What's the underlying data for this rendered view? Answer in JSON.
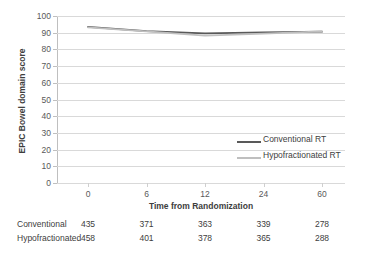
{
  "chart_data": {
    "type": "line",
    "title": "",
    "xlabel": "Time from Randomization",
    "ylabel": "EPIC Bowel domain score",
    "x": [
      0,
      6,
      12,
      24,
      60
    ],
    "xtick_labels": [
      "0",
      "6",
      "12",
      "24",
      "60"
    ],
    "ytick_labels": [
      "0",
      "10",
      "20",
      "30",
      "40",
      "50",
      "60",
      "70",
      "80",
      "90",
      "100"
    ],
    "ylim": [
      0,
      100
    ],
    "ytick_step": 10,
    "grid": "horizontal",
    "legend_position": "inside-right",
    "series": [
      {
        "name": "Conventional RT",
        "color": "#595959",
        "values": [
          93.5,
          91.0,
          89.6,
          90.2,
          90.6
        ]
      },
      {
        "name": "Hypofractionated RT",
        "color": "#bfbfbf",
        "values": [
          93.2,
          90.8,
          88.2,
          89.4,
          90.8
        ]
      }
    ]
  },
  "legend": {
    "items": [
      {
        "label": "Conventional RT",
        "color": "#595959"
      },
      {
        "label": "Hypofractionated RT",
        "color": "#bfbfbf"
      }
    ]
  },
  "risk_table": {
    "rows": [
      {
        "label": "Conventional",
        "values": [
          "435",
          "371",
          "363",
          "339",
          "278"
        ]
      },
      {
        "label": "Hypofractionated",
        "values": [
          "458",
          "401",
          "378",
          "365",
          "288"
        ]
      }
    ]
  }
}
